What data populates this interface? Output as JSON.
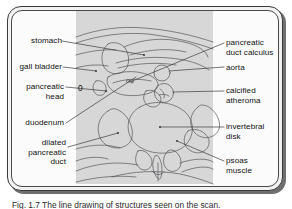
{
  "figure": {
    "kind": "annotated-ct-cross-section-line-drawing",
    "colors": {
      "page_background": "#ffffff",
      "frame_fill": "#f2f2f2",
      "frame_border": "#3a3a3a",
      "inner_panel": "#fbfbfb",
      "scan_plate": "#d7d7d7",
      "ink": "#4b4b52",
      "leader_line": "#3c3c3c",
      "text": "#111111",
      "shadow": "#6f6f6f"
    },
    "plate_marker": "0",
    "caption": "Fig. 1.7 The line drawing of structures seen on the scan."
  },
  "labels": {
    "left": [
      {
        "id": "stomach",
        "text": "stomach"
      },
      {
        "id": "gall-bladder",
        "text": "gall bladder"
      },
      {
        "id": "pancreatic-head",
        "text": "pancreatic\nhead"
      },
      {
        "id": "duodenum",
        "text": "duodenum"
      },
      {
        "id": "dilated-pancreatic-duct",
        "text": "dilated\npancreatic\nduct"
      }
    ],
    "right": [
      {
        "id": "pancreatic-duct-calculus",
        "text": "pancreatic\nduct calculus"
      },
      {
        "id": "aorta",
        "text": "aorta"
      },
      {
        "id": "calcified-atheroma",
        "text": "calcified\natheroma"
      },
      {
        "id": "invertebral-disk",
        "text": "invertebral\ndisk"
      },
      {
        "id": "psoas-muscle",
        "text": "psoas\nmuscle"
      }
    ]
  }
}
